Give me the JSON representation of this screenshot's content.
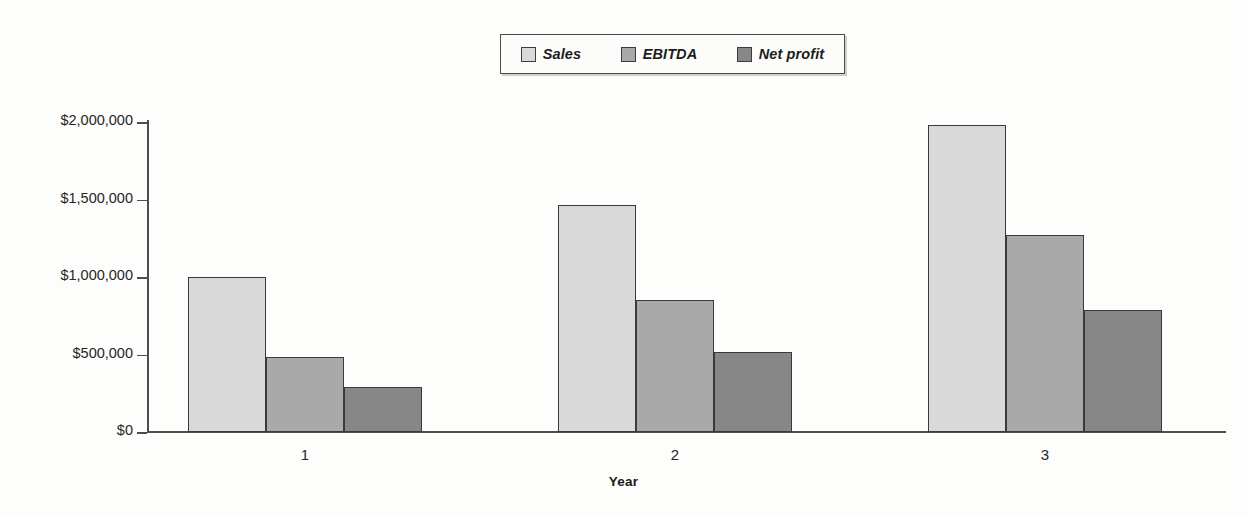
{
  "chart_data": {
    "type": "bar",
    "title": "",
    "xlabel": "Year",
    "ylabel": "",
    "categories": [
      "1",
      "2",
      "3"
    ],
    "series": [
      {
        "name": "Sales",
        "values": [
          1000000,
          1465000,
          1980000
        ],
        "color": "#d9d9d9"
      },
      {
        "name": "EBITDA",
        "values": [
          484000,
          852000,
          1271000
        ],
        "color": "#a9a9a9"
      },
      {
        "name": "Net profit",
        "values": [
          290000,
          516000,
          787000
        ],
        "color": "#878787"
      }
    ],
    "ylim": [
      0,
      2000000
    ],
    "yticks": [
      0,
      500000,
      1000000,
      1500000,
      2000000
    ],
    "ytick_labels": [
      "$0",
      "$500,000",
      "$1,000,000",
      "$1,500,000",
      "$2,000,000"
    ],
    "grid": false,
    "legend_position": "top-center"
  },
  "legend": {
    "items": [
      {
        "label": "Sales",
        "color": "#d9d9d9"
      },
      {
        "label": "EBITDA",
        "color": "#a9a9a9"
      },
      {
        "label": "Net profit",
        "color": "#878787"
      }
    ]
  },
  "axes": {
    "x_title": "Year"
  }
}
